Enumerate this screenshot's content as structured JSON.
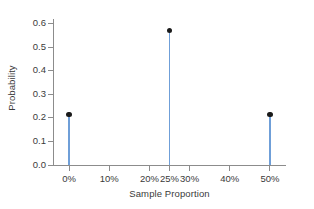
{
  "chart_data": {
    "type": "bar",
    "plot_style": "stem",
    "title": "",
    "xlabel": "Sample Proportion",
    "ylabel": "Probability",
    "categories": [
      "0%",
      "25%",
      "50%"
    ],
    "x": [
      0,
      25,
      50
    ],
    "values": [
      0.215,
      0.57,
      0.215
    ],
    "xlim": [
      -4,
      54
    ],
    "ylim": [
      0.0,
      0.62
    ],
    "grid": false,
    "legend": false,
    "xtick_labels": [
      "0%",
      "10%",
      "20%",
      "25%",
      "30%",
      "40%",
      "50%"
    ],
    "xtick_values": [
      0,
      10,
      20,
      25,
      30,
      40,
      50
    ],
    "ytick_labels": [
      "0.0",
      "0.1",
      "0.2",
      "0.3",
      "0.4",
      "0.5",
      "0.6"
    ],
    "ytick_values": [
      0.0,
      0.1,
      0.2,
      0.3,
      0.4,
      0.5,
      0.6
    ],
    "colors": {
      "stem": "#6f9fd8",
      "marker": "#1a1a1a",
      "axis": "#8c8c8c",
      "text": "#3a3a3a",
      "background": "#ffffff"
    }
  }
}
